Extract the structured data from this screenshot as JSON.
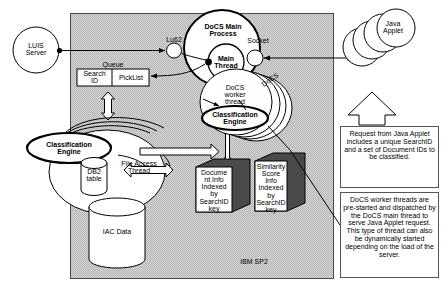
{
  "diagram": {
    "panel_label": "IBM SP2",
    "external": {
      "luis_server": "LUIS\nServer",
      "java_applet": "Java\nApplet"
    },
    "links": {
      "lu62": "Lu62",
      "socket": "Socket"
    },
    "queue": {
      "label": "Queue",
      "cells": [
        "Search\nID",
        "PickList"
      ]
    },
    "main_process": {
      "label": "DoCS Main\nProcess",
      "main_thread": "Main\nThread"
    },
    "worker": {
      "label": "DoCS\nworker\nthread",
      "engine": "Classification\nEngine",
      "stack_label": "DoCS"
    },
    "classifier": {
      "engine": "Classification\nEngine",
      "file_access_thread": "File Access\nThread"
    },
    "stores": {
      "db2": "DB2\ntable",
      "iac": "IAC Data"
    },
    "data_blocks": [
      {
        "name": "document-info-block",
        "text": "Docume\nnt Info\nIndexed\nby\nSearchID\nkey"
      },
      {
        "name": "similarity-score-block",
        "text": "Similarity\nScore\nInfo\nIndexed\nby\nSearchID\nkey"
      }
    ],
    "notes": [
      {
        "name": "request-note",
        "text": "Request from Java Applet includes a unique SearchID and  a set of Document IDs to be classified."
      },
      {
        "name": "worker-thread-note",
        "text": "DoCS worker threads are pre-started and dispatched  by the DoCS main thread to serve Java Applet request. This type of thread can also be dynamically started depending on the load of the server."
      }
    ],
    "colors": {
      "panel_fill": "#c7c7c7",
      "stroke": "#000000",
      "block_shadow": "#4a4a4a",
      "note_border": "#555555"
    }
  }
}
